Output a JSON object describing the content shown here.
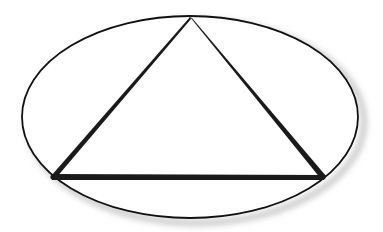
{
  "diagram": {
    "shapes": {
      "ellipse": {
        "label": "ellipse",
        "stroke_color": "#111111",
        "fill_color": "#ffffff",
        "shadow_color": "#bdbdbd"
      },
      "triangle": {
        "label": "inscribed triangle",
        "stroke_color": "#1a1a1a",
        "vertices": [
          "apex-top",
          "bottom-left",
          "bottom-right"
        ],
        "edges": [
          "left-side",
          "right-side",
          "base"
        ]
      }
    }
  }
}
